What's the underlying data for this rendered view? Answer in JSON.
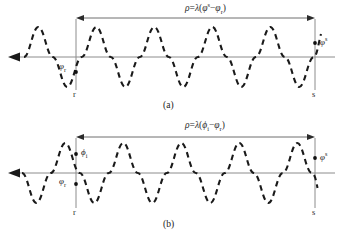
{
  "figure": {
    "caption_a": "(a)",
    "caption_b": "(b)"
  },
  "panel_a": {
    "formula": {
      "rho": "ρ",
      "equals": "=",
      "lambda": "λ",
      "open": "(",
      "phi_sat": "φ",
      "sup_sat": "s",
      "minus": "−",
      "phi_rec": "φ",
      "sub_rec": "r",
      "close": ")",
      "full_text": "ρ=λ(φˢ−φᵣ)"
    },
    "labels": {
      "phi_receiver": "φ",
      "phi_receiver_sub": "r",
      "phi_satellite": "φ",
      "phi_satellite_sup": "s",
      "endpoint_left": "r",
      "endpoint_right": "s"
    }
  },
  "panel_b": {
    "formula": {
      "rho": "ρ",
      "equals": "=",
      "lambda": "λ",
      "open": "(",
      "phi_i": "ϕ",
      "sub_i": "i",
      "minus": "−",
      "phi_rec": "φ",
      "sub_rec": "r",
      "close": ")",
      "full_text": "ρ=λ(ϕᵢ−φᵣ)"
    },
    "labels": {
      "phi_i": "ϕ",
      "phi_i_sub": "i",
      "phi_receiver": "φ",
      "phi_receiver_sub": "r",
      "phi_satellite": "φ",
      "phi_satellite_sup": "s",
      "endpoint_left": "r",
      "endpoint_right": "s"
    }
  },
  "colors": {
    "wave": "#1a1a1a",
    "axis": "#8c8c8c",
    "dimension": "#6e6e6e",
    "background": "#ffffff"
  },
  "geometry": {
    "r_line_x": 76,
    "s_line_x": 315,
    "note_cycles": "4.5"
  }
}
